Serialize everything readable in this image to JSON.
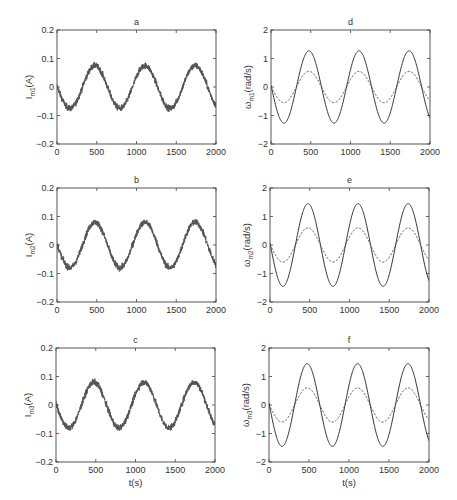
{
  "figure": {
    "xlabel_bottom": "t(s)",
    "panels": [
      {
        "id": "a",
        "title": "a",
        "ylabel_main": "I",
        "ylabel_sub": "m1",
        "ylabel_unit": "(A)"
      },
      {
        "id": "b",
        "title": "b",
        "ylabel_main": "I",
        "ylabel_sub": "m2",
        "ylabel_unit": "(A)"
      },
      {
        "id": "c",
        "title": "c",
        "ylabel_main": "I",
        "ylabel_sub": "m3",
        "ylabel_unit": "(A)"
      },
      {
        "id": "d",
        "title": "d",
        "ylabel_main": "ω",
        "ylabel_sub": "m1",
        "ylabel_unit": "(rad/s)"
      },
      {
        "id": "e",
        "title": "e",
        "ylabel_main": "ω",
        "ylabel_sub": "m2",
        "ylabel_unit": "(rad/s)"
      },
      {
        "id": "f",
        "title": "f",
        "ylabel_main": "ω",
        "ylabel_sub": "m3",
        "ylabel_unit": "(rad/s)"
      }
    ]
  },
  "chart_data": [
    {
      "panel": "a",
      "type": "line",
      "title": "a",
      "xlabel": "",
      "ylabel": "I_m1(A)",
      "xlim": [
        0,
        2000
      ],
      "ylim": [
        -0.2,
        0.2
      ],
      "xticks": [
        0,
        500,
        1000,
        1500,
        2000
      ],
      "yticks": [
        -0.2,
        -0.1,
        0,
        0.1,
        0.2
      ],
      "ytick_labels": [
        "−0.2",
        "−0.1",
        "0",
        "0.1",
        "0.2"
      ],
      "series": [
        {
          "name": "I_m1",
          "style": "solid-noisy",
          "color": "#555555",
          "model": "sinusoid",
          "amplitude": 0.075,
          "period": 630,
          "phase_shift": 320,
          "noise": 0.012,
          "x": [
            0,
            160,
            320,
            480,
            630,
            790,
            950,
            1110,
            1260,
            1420,
            1580,
            1730,
            1890,
            2000
          ],
          "y": [
            0.0,
            -0.075,
            0.0,
            0.075,
            0.0,
            -0.075,
            0.0,
            0.075,
            0.0,
            -0.075,
            0.0,
            0.075,
            0.0,
            -0.07
          ]
        }
      ]
    },
    {
      "panel": "b",
      "type": "line",
      "title": "b",
      "xlabel": "",
      "ylabel": "I_m2(A)",
      "xlim": [
        0,
        2000
      ],
      "ylim": [
        -0.2,
        0.2
      ],
      "xticks": [
        0,
        500,
        1000,
        1500,
        2000
      ],
      "yticks": [
        -0.2,
        -0.1,
        0,
        0.1,
        0.2
      ],
      "ytick_labels": [
        "−0.2",
        "−0.1",
        "0",
        "0.1",
        "0.2"
      ],
      "series": [
        {
          "name": "I_m2",
          "style": "solid-noisy",
          "color": "#555555",
          "model": "sinusoid",
          "amplitude": 0.08,
          "period": 630,
          "phase_shift": 320,
          "noise": 0.012,
          "x": [
            0,
            160,
            320,
            480,
            630,
            790,
            950,
            1110,
            1260,
            1420,
            1580,
            1730,
            1890,
            2000
          ],
          "y": [
            0.0,
            -0.08,
            0.0,
            0.08,
            0.0,
            -0.08,
            0.0,
            0.08,
            0.0,
            -0.08,
            0.0,
            0.08,
            0.0,
            -0.075
          ]
        }
      ]
    },
    {
      "panel": "c",
      "type": "line",
      "title": "c",
      "xlabel": "t(s)",
      "ylabel": "I_m3(A)",
      "xlim": [
        0,
        2000
      ],
      "ylim": [
        -0.2,
        0.2
      ],
      "xticks": [
        0,
        500,
        1000,
        1500,
        2000
      ],
      "yticks": [
        -0.2,
        -0.1,
        0,
        0.1,
        0.2
      ],
      "ytick_labels": [
        "−0.2",
        "−0.1",
        "0",
        "0.1",
        "0.2"
      ],
      "series": [
        {
          "name": "I_m3",
          "style": "solid-noisy",
          "color": "#555555",
          "model": "sinusoid",
          "amplitude": 0.08,
          "period": 630,
          "phase_shift": 320,
          "noise": 0.012,
          "x": [
            0,
            160,
            320,
            480,
            630,
            790,
            950,
            1110,
            1260,
            1420,
            1580,
            1730,
            1890,
            2000
          ],
          "y": [
            0.0,
            -0.08,
            0.0,
            0.08,
            0.0,
            -0.08,
            0.0,
            0.08,
            0.0,
            -0.08,
            0.0,
            0.08,
            0.0,
            -0.075
          ]
        }
      ]
    },
    {
      "panel": "d",
      "type": "line",
      "title": "d",
      "xlabel": "",
      "ylabel": "ω_m1(rad/s)",
      "xlim": [
        0,
        2000
      ],
      "ylim": [
        -2,
        2
      ],
      "xticks": [
        0,
        500,
        1000,
        1500,
        2000
      ],
      "yticks": [
        -2,
        -1,
        0,
        1,
        2
      ],
      "ytick_labels": [
        "−2",
        "−1",
        "0",
        "1",
        "2"
      ],
      "series": [
        {
          "name": "solid",
          "style": "solid",
          "color": "#333333",
          "model": "sinusoid",
          "amplitude": 1.27,
          "period": 630,
          "phase_shift": 320,
          "x": [
            0,
            160,
            320,
            480,
            630,
            790,
            950,
            1110,
            1260,
            1420,
            1580,
            1730,
            1890,
            2000
          ],
          "y": [
            0.0,
            -1.27,
            0.0,
            1.27,
            0.0,
            -1.27,
            0.0,
            1.27,
            0.0,
            -1.27,
            0.0,
            1.27,
            0.0,
            -1.15
          ]
        },
        {
          "name": "dashed",
          "style": "dashed",
          "color": "#555555",
          "model": "sinusoid",
          "amplitude": 0.55,
          "period": 630,
          "phase_shift": 320,
          "x": [
            0,
            160,
            320,
            480,
            630,
            790,
            950,
            1110,
            1260,
            1420,
            1580,
            1730,
            1890,
            2000
          ],
          "y": [
            0.0,
            -0.55,
            0.0,
            0.55,
            0.0,
            -0.55,
            0.0,
            0.55,
            0.0,
            -0.55,
            0.0,
            0.55,
            0.0,
            -0.5
          ]
        }
      ]
    },
    {
      "panel": "e",
      "type": "line",
      "title": "e",
      "xlabel": "",
      "ylabel": "ω_m2(rad/s)",
      "xlim": [
        0,
        2000
      ],
      "ylim": [
        -2,
        2
      ],
      "xticks": [
        0,
        500,
        1000,
        1500,
        2000
      ],
      "yticks": [
        -2,
        -1,
        0,
        1,
        2
      ],
      "ytick_labels": [
        "−2",
        "−1",
        "0",
        "1",
        "2"
      ],
      "series": [
        {
          "name": "solid",
          "style": "solid",
          "color": "#333333",
          "model": "sinusoid",
          "amplitude": 1.45,
          "period": 630,
          "phase_shift": 320,
          "x": [
            0,
            160,
            320,
            480,
            630,
            790,
            950,
            1110,
            1260,
            1420,
            1580,
            1730,
            1890,
            2000
          ],
          "y": [
            0.0,
            -1.45,
            0.0,
            1.45,
            0.0,
            -1.45,
            0.0,
            1.45,
            0.0,
            -1.45,
            0.0,
            1.45,
            0.0,
            -1.3
          ]
        },
        {
          "name": "dashed",
          "style": "dashed",
          "color": "#555555",
          "model": "sinusoid",
          "amplitude": 0.6,
          "period": 630,
          "phase_shift": 320,
          "x": [
            0,
            160,
            320,
            480,
            630,
            790,
            950,
            1110,
            1260,
            1420,
            1580,
            1730,
            1890,
            2000
          ],
          "y": [
            0.0,
            -0.6,
            0.0,
            0.6,
            0.0,
            -0.6,
            0.0,
            0.6,
            0.0,
            -0.6,
            0.0,
            0.6,
            0.0,
            -0.55
          ]
        }
      ]
    },
    {
      "panel": "f",
      "type": "line",
      "title": "f",
      "xlabel": "t(s)",
      "ylabel": "ω_m3(rad/s)",
      "xlim": [
        0,
        2000
      ],
      "ylim": [
        -2,
        2
      ],
      "xticks": [
        0,
        500,
        1000,
        1500,
        2000
      ],
      "yticks": [
        -2,
        -1,
        0,
        1,
        2
      ],
      "ytick_labels": [
        "−2",
        "−1",
        "0",
        "1",
        "2"
      ],
      "series": [
        {
          "name": "solid",
          "style": "solid",
          "color": "#333333",
          "model": "sinusoid",
          "amplitude": 1.45,
          "period": 630,
          "phase_shift": 320,
          "x": [
            0,
            160,
            320,
            480,
            630,
            790,
            950,
            1110,
            1260,
            1420,
            1580,
            1730,
            1890,
            2000
          ],
          "y": [
            0.0,
            -1.45,
            0.0,
            1.45,
            0.0,
            -1.45,
            0.0,
            1.45,
            0.0,
            -1.45,
            0.0,
            1.45,
            0.0,
            -1.3
          ]
        },
        {
          "name": "dashed",
          "style": "dashed",
          "color": "#555555",
          "model": "sinusoid",
          "amplitude": 0.6,
          "period": 630,
          "phase_shift": 320,
          "x": [
            0,
            160,
            320,
            480,
            630,
            790,
            950,
            1110,
            1260,
            1420,
            1580,
            1730,
            1890,
            2000
          ],
          "y": [
            0.0,
            -0.6,
            0.0,
            0.6,
            0.0,
            -0.6,
            0.0,
            0.6,
            0.0,
            -0.6,
            0.0,
            0.6,
            0.0,
            -0.55
          ]
        }
      ]
    }
  ]
}
